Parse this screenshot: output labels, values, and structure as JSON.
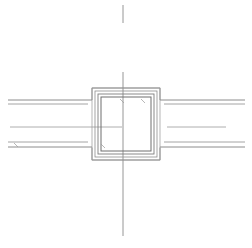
{
  "document": {
    "title": "Junction Box Plan Detail",
    "background_color": "#ffffff",
    "width": 252,
    "height": 248
  },
  "style": {
    "object_line_color": "#808080",
    "object_line_color_dark": "#6e6e6e",
    "centerline_color": "#8a8a8a",
    "thin_line_color": "#9a9a9a",
    "object_line_width": 0.9,
    "centerline_width": 0.9,
    "thin_line_width": 0.7
  },
  "geometry": {
    "vertical_centerline": {
      "x": 123,
      "segments": [
        {
          "y1": 5,
          "y2": 23
        },
        {
          "y1": 72,
          "y2": 236
        }
      ]
    },
    "horizontal_centerline": {
      "y": 127,
      "segments": [
        {
          "x1": 10,
          "x2": 122
        },
        {
          "x1": 167,
          "x2": 226
        }
      ]
    },
    "left_rails": [
      {
        "y": 100,
        "x1": 8,
        "x2": 92
      },
      {
        "y": 104,
        "x1": 8,
        "x2": 88
      },
      {
        "y": 142,
        "x1": 8,
        "x2": 88
      },
      {
        "y": 147,
        "x1": 8,
        "x2": 92
      }
    ],
    "right_rails": [
      {
        "y": 100,
        "x1": 160,
        "x2": 245
      },
      {
        "y": 104,
        "x1": 164,
        "x2": 245
      },
      {
        "y": 142,
        "x1": 164,
        "x2": 245
      },
      {
        "y": 147,
        "x1": 160,
        "x2": 245
      }
    ],
    "outer_profile": {
      "name": "outer-flange-profile",
      "points": "8,100 92,100 92,88 160,88 160,100 245,100 245,104 164,104 164,142 245,142 245,147 160,147 160,160 92,160 92,147 8,147"
    },
    "nested_rectangles": [
      {
        "name": "ring-1",
        "x": 92,
        "y": 88,
        "w": 68,
        "h": 72
      },
      {
        "name": "ring-2",
        "x": 95,
        "y": 91,
        "w": 62,
        "h": 66
      },
      {
        "name": "ring-3",
        "x": 98,
        "y": 94,
        "w": 56,
        "h": 60
      },
      {
        "name": "ring-4",
        "x": 101,
        "y": 97,
        "w": 50,
        "h": 54
      }
    ],
    "leader_ticks": [
      {
        "name": "tick-upper-left",
        "x1": 120,
        "y1": 99,
        "x2": 124,
        "y2": 103
      },
      {
        "name": "tick-upper-right",
        "x1": 141,
        "y1": 99,
        "x2": 145,
        "y2": 103
      },
      {
        "name": "tick-lower-left",
        "x1": 101,
        "y1": 144,
        "x2": 105,
        "y2": 148
      },
      {
        "name": "tick-left-rail",
        "x1": 14,
        "y1": 143,
        "x2": 18,
        "y2": 147
      }
    ]
  },
  "labels": {
    "view_name": "",
    "scale": "",
    "notes": ""
  }
}
